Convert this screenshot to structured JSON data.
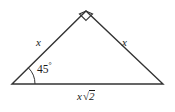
{
  "figure": {
    "background_color": "#ffffff",
    "stroke_color": "#333333",
    "text_color": "#1a1a1a"
  },
  "labels": {
    "left_leg": "x",
    "right_leg": "x",
    "angle_bottom_left": "45",
    "angle_degree_symbol": "°",
    "hypotenuse_variable": "x",
    "hypotenuse_radical_sign": "√",
    "hypotenuse_radicand": "2"
  },
  "geometry": {
    "vertices": {
      "bottom_left": [
        12,
        84
      ],
      "apex": [
        86,
        11
      ],
      "bottom_right": [
        163,
        84
      ]
    },
    "right_angle_marker": {
      "at": "apex",
      "type": "square",
      "size_px": 9,
      "filled": false
    },
    "angle_arc": {
      "at": "bottom_left",
      "measure_degrees": 45,
      "radius_px": 23
    },
    "side_lengths": {
      "left_leg": "x",
      "right_leg": "x",
      "hypotenuse": "x√2"
    }
  }
}
